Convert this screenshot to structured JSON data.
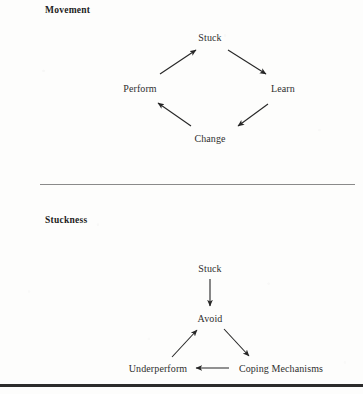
{
  "page": {
    "width": 363,
    "height": 394,
    "background_color": "#fdfdfc",
    "text_color": "#2a2a2a"
  },
  "sections": [
    {
      "heading": "Movement",
      "diagram_type": "cycle",
      "direction": "counterclockwise",
      "nodes": [
        {
          "label": "Stuck",
          "x": 210,
          "y": 37
        },
        {
          "label": "Learn",
          "x": 283,
          "y": 88
        },
        {
          "label": "Change",
          "x": 210,
          "y": 138
        },
        {
          "label": "Perform",
          "x": 140,
          "y": 88
        }
      ],
      "edges": [
        {
          "from": "Perform",
          "to": "Stuck",
          "style": "diagonal-up-right"
        },
        {
          "from": "Stuck",
          "to": "Learn",
          "style": "diagonal-down-right"
        },
        {
          "from": "Learn",
          "to": "Change",
          "style": "diagonal-down-left"
        },
        {
          "from": "Change",
          "to": "Perform",
          "style": "diagonal-up-left"
        }
      ]
    },
    {
      "heading": "Stuckness",
      "diagram_type": "loop",
      "direction": "clockwise",
      "nodes": [
        {
          "label": "Stuck",
          "x": 210,
          "y": 268
        },
        {
          "label": "Avoid",
          "x": 210,
          "y": 318
        },
        {
          "label": "Coping Mechanisms",
          "x": 281,
          "y": 368
        },
        {
          "label": "Underperform",
          "x": 158,
          "y": 368
        }
      ],
      "edges": [
        {
          "from": "Stuck",
          "to": "Avoid",
          "style": "vertical-down"
        },
        {
          "from": "Avoid",
          "to": "Coping Mechanisms",
          "style": "diagonal-down-right"
        },
        {
          "from": "Coping Mechanisms",
          "to": "Underperform",
          "style": "horizontal-left"
        },
        {
          "from": "Underperform",
          "to": "Avoid",
          "style": "diagonal-up-right"
        }
      ]
    }
  ],
  "dividers": [
    {
      "name": "thin-rule",
      "color": "#8a8a8a",
      "thickness": 1
    },
    {
      "name": "thick-rule",
      "color": "#2b2b2b",
      "thickness": 3
    }
  ]
}
